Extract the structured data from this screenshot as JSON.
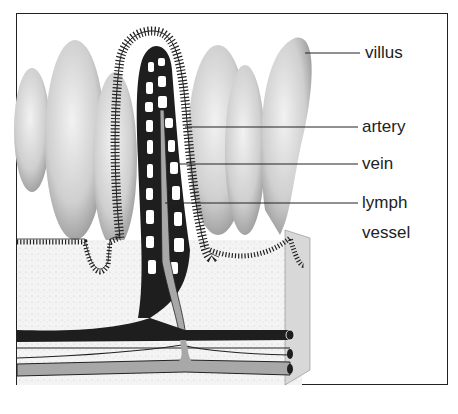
{
  "diagram": {
    "labels": [
      {
        "id": "villus",
        "text": "villus"
      },
      {
        "id": "artery",
        "text": "artery"
      },
      {
        "id": "vein",
        "text": "vein"
      },
      {
        "id": "lymph",
        "text": "lymph"
      },
      {
        "id": "vessel",
        "text": "vessel"
      }
    ],
    "colors": {
      "outline": "#1a1a1a",
      "vein": "#1e1e1e",
      "lymph": "#a8a8a8",
      "tissue_shade": "#bdbdbd",
      "background": "#ffffff"
    }
  }
}
